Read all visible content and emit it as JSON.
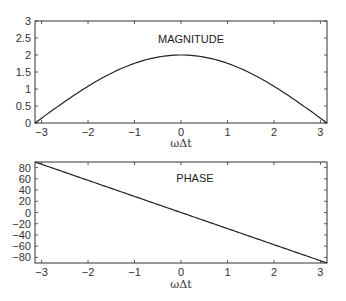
{
  "chart_data": [
    {
      "type": "line",
      "title": "MAGNITUDE",
      "xlabel": "ωΔt",
      "ylabel": "",
      "xlim": [
        -3.14159,
        3.14159
      ],
      "ylim": [
        0,
        3
      ],
      "xticks": [
        -3,
        -2,
        -1,
        0,
        1,
        2,
        3
      ],
      "yticks": [
        0,
        0.5,
        1,
        1.5,
        2,
        2.5,
        3
      ],
      "ytick_labels": [
        "0",
        "0.5",
        "1",
        "1.5",
        "2",
        "2.5",
        "3"
      ],
      "grid": false,
      "series": [
        {
          "name": "magnitude",
          "function": "2*cos(x/2)",
          "x": [
            -3.14,
            -3,
            -2.5,
            -2,
            -1.5,
            -1,
            -0.5,
            0,
            0.5,
            1,
            1.5,
            2,
            2.5,
            3,
            3.14
          ],
          "y": [
            0.0,
            0.14,
            0.63,
            1.08,
            1.46,
            1.76,
            1.94,
            2.0,
            1.94,
            1.76,
            1.46,
            1.08,
            0.63,
            0.14,
            0.0
          ]
        }
      ]
    },
    {
      "type": "line",
      "title": "PHASE",
      "xlabel": "ωΔt",
      "ylabel": "",
      "xlim": [
        -3.14159,
        3.14159
      ],
      "ylim": [
        -90,
        90
      ],
      "xticks": [
        -3,
        -2,
        -1,
        0,
        1,
        2,
        3
      ],
      "yticks": [
        -80,
        -60,
        -40,
        -20,
        0,
        20,
        40,
        60,
        80
      ],
      "ytick_labels": [
        "−80",
        "−60",
        "−40",
        "−20",
        "0",
        "20",
        "40",
        "60",
        "80"
      ],
      "grid": false,
      "series": [
        {
          "name": "phase",
          "function": "-x/2 in degrees",
          "x": [
            -3.14,
            -3,
            -2,
            -1,
            0,
            1,
            2,
            3,
            3.14
          ],
          "y": [
            90,
            85.9,
            57.3,
            28.6,
            0,
            -28.6,
            -57.3,
            -85.9,
            -90
          ]
        }
      ]
    }
  ],
  "xtick_labels": [
    "−3",
    "−2",
    "−1",
    "0",
    "1",
    "2",
    "3"
  ],
  "panels": [
    {
      "title": "MAGNITUDE",
      "xlabel": "ωΔt"
    },
    {
      "title": "PHASE",
      "xlabel": "ωΔt"
    }
  ]
}
